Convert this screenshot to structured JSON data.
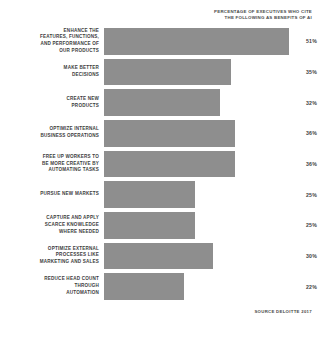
{
  "header": {
    "line1": "PERCENTAGE OF EXECUTIVES WHO CITE",
    "line2": "THE FOLLOWING AS BENEFITS OF AI"
  },
  "source": "SOURCE DELOITTE 2017",
  "colors": {
    "bar": "#8e8e8e",
    "text": "#3d3d3d",
    "background": "#ffffff"
  },
  "chart_data": {
    "type": "bar",
    "orientation": "horizontal",
    "title": "PERCENTAGE OF EXECUTIVES WHO CITE THE FOLLOWING AS BENEFITS OF AI",
    "xlabel": "",
    "ylabel": "",
    "xlim": [
      0,
      51
    ],
    "grid": false,
    "legend": false,
    "unit": "%",
    "categories": [
      "ENHANCE THE FEATURES, FUNCTIONS, AND PERFORMANCE OF OUR PRODUCTS",
      "MAKE BETTER DECISIONS",
      "CREATE NEW PRODUCTS",
      "OPTIMIZE INTERNAL BUSINESS OPERATIONS",
      "FREE UP WORKERS TO BE MORE CREATIVE BY AUTOMATING TASKS",
      "PURSUE NEW MARKETS",
      "CAPTURE AND APPLY SCARCE KNOWLEDGE WHERE NEEDED",
      "OPTIMIZE EXTERNAL PROCESSES LIKE MARKETING AND SALES",
      "REDUCE HEAD COUNT THROUGH AUTOMATION"
    ],
    "values": [
      51,
      35,
      32,
      36,
      36,
      25,
      25,
      30,
      22
    ],
    "value_labels": [
      "51%",
      "35%",
      "32%",
      "36%",
      "36%",
      "25%",
      "25%",
      "30%",
      "22%"
    ]
  },
  "rows": [
    {
      "label_lines": [
        "ENHANCE THE",
        "FEATURES, FUNCTIONS,",
        "AND PERFORMANCE OF",
        "OUR PRODUCTS"
      ],
      "value_label": "51%",
      "value": 51
    },
    {
      "label_lines": [
        "MAKE BETTER",
        "DECISIONS"
      ],
      "value_label": "35%",
      "value": 35
    },
    {
      "label_lines": [
        "CREATE NEW",
        "PRODUCTS"
      ],
      "value_label": "32%",
      "value": 32
    },
    {
      "label_lines": [
        "OPTIMIZE INTERNAL",
        "BUSINESS OPERATIONS"
      ],
      "value_label": "36%",
      "value": 36
    },
    {
      "label_lines": [
        "FREE UP WORKERS TO",
        "BE MORE CREATIVE BY",
        "AUTOMATING TASKS"
      ],
      "value_label": "36%",
      "value": 36
    },
    {
      "label_lines": [
        "PURSUE NEW MARKETS"
      ],
      "value_label": "25%",
      "value": 25
    },
    {
      "label_lines": [
        "CAPTURE AND APPLY",
        "SCARCE KNOWLEDGE",
        "WHERE NEEDED"
      ],
      "value_label": "25%",
      "value": 25
    },
    {
      "label_lines": [
        "OPTIMIZE EXTERNAL",
        "PROCESSES LIKE",
        "MARKETING AND SALES"
      ],
      "value_label": "30%",
      "value": 30
    },
    {
      "label_lines": [
        "REDUCE HEAD COUNT",
        "THROUGH",
        "AUTOMATION"
      ],
      "value_label": "22%",
      "value": 22
    }
  ]
}
